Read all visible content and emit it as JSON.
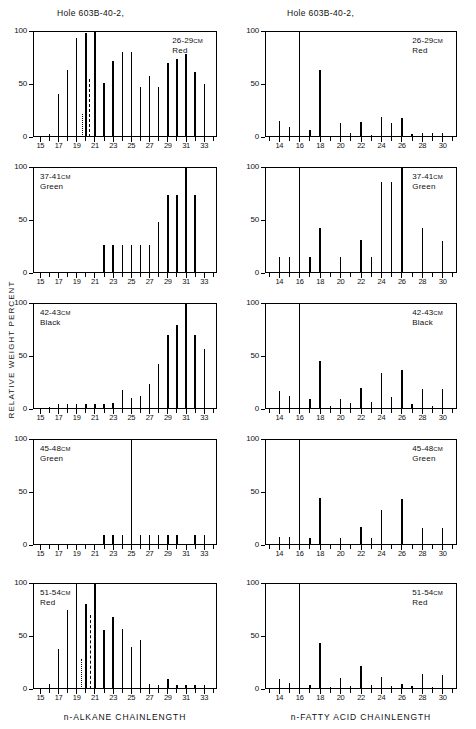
{
  "figure": {
    "y_axis_label": "RELATIVE WEIGHT PERCENT",
    "column_titles": {
      "left": "Hole 603B-40-2,",
      "right": "Hole 603B-40-2,"
    },
    "x_axis_labels": {
      "left": "n-ALKANE  CHAINLENGTH",
      "right": "n-FATTY ACID CHAINLENGTH"
    },
    "y_ticks": [
      "0",
      "50",
      "100"
    ],
    "cm_unit": "CM"
  },
  "chart_data": [
    {
      "type": "bar",
      "panel_id": "alkane-26-29",
      "column": "left",
      "row": 1,
      "title": "Hole 603B-40-2,",
      "annotation_depth": "26-29",
      "annotation_unit": "CM",
      "annotation_color": "Red",
      "xlabel": "n-ALKANE  CHAINLENGTH",
      "ylabel": "RELATIVE WEIGHT PERCENT",
      "xlim": [
        14.2,
        34.4
      ],
      "ylim": [
        0,
        100
      ],
      "grid": false,
      "tick_labels": [
        "15",
        "17",
        "19",
        "21",
        "23",
        "25",
        "27",
        "29",
        "31",
        "33"
      ],
      "x": [
        15,
        16,
        17,
        18,
        19,
        20,
        21,
        22,
        23,
        24,
        25,
        26,
        27,
        28,
        29,
        30,
        31,
        32,
        33,
        34
      ],
      "values": [
        0,
        3,
        41,
        63,
        93,
        98,
        100,
        51,
        72,
        80,
        80,
        47,
        58,
        47,
        70,
        74,
        78,
        61,
        50,
        0
      ],
      "markers": [
        {
          "name": "pristane",
          "x": 19.65,
          "value": 22,
          "style": "dotted"
        },
        {
          "name": "phytane",
          "x": 20.45,
          "value": 55,
          "style": "dashed"
        }
      ]
    },
    {
      "type": "bar",
      "panel_id": "fattyacid-26-29",
      "column": "right",
      "row": 1,
      "title": "Hole 603B-40-2,",
      "annotation_depth": "26-29",
      "annotation_unit": "CM",
      "annotation_color": "Red",
      "xlabel": "n-FATTY ACID CHAINLENGTH",
      "ylabel": "RELATIVE WEIGHT PERCENT",
      "xlim": [
        12.6,
        31.4
      ],
      "ylim": [
        0,
        100
      ],
      "grid": false,
      "tick_labels": [
        "14",
        "16",
        "18",
        "20",
        "22",
        "24",
        "26",
        "28",
        "30"
      ],
      "x": [
        13,
        14,
        15,
        16,
        17,
        18,
        19,
        20,
        21,
        22,
        23,
        24,
        25,
        26,
        27,
        28,
        29,
        30,
        31
      ],
      "values": [
        0,
        15,
        9,
        100,
        7,
        63,
        0,
        13,
        4,
        14,
        2,
        19,
        13,
        18,
        3,
        4,
        4,
        4,
        0
      ],
      "markers": []
    },
    {
      "type": "bar",
      "panel_id": "alkane-37-41",
      "column": "left",
      "row": 2,
      "annotation_depth": "37-41",
      "annotation_unit": "CM",
      "annotation_color": "Green",
      "xlabel": "n-ALKANE  CHAINLENGTH",
      "ylabel": "RELATIVE WEIGHT PERCENT",
      "xlim": [
        14.2,
        34.4
      ],
      "ylim": [
        0,
        100
      ],
      "grid": false,
      "tick_labels": [
        "15",
        "17",
        "19",
        "21",
        "23",
        "25",
        "27",
        "29",
        "31",
        "33"
      ],
      "x": [
        15,
        16,
        17,
        18,
        19,
        20,
        21,
        22,
        23,
        24,
        25,
        26,
        27,
        28,
        29,
        30,
        31,
        32,
        33,
        34
      ],
      "values": [
        0,
        0,
        0,
        0,
        0,
        0,
        0,
        26,
        26,
        26,
        26,
        26,
        26,
        48,
        74,
        74,
        100,
        74,
        0,
        0
      ],
      "markers": []
    },
    {
      "type": "bar",
      "panel_id": "fattyacid-37-41",
      "column": "right",
      "row": 2,
      "annotation_depth": "37-41",
      "annotation_unit": "CM",
      "annotation_color": "Green",
      "xlabel": "n-FATTY ACID CHAINLENGTH",
      "ylabel": "RELATIVE WEIGHT PERCENT",
      "xlim": [
        12.6,
        31.4
      ],
      "ylim": [
        0,
        100
      ],
      "grid": false,
      "tick_labels": [
        "14",
        "16",
        "18",
        "20",
        "22",
        "24",
        "26",
        "28",
        "30"
      ],
      "x": [
        13,
        14,
        15,
        16,
        17,
        18,
        19,
        20,
        21,
        22,
        23,
        24,
        25,
        26,
        27,
        28,
        29,
        30,
        31
      ],
      "values": [
        0,
        15,
        15,
        100,
        15,
        42,
        0,
        15,
        0,
        31,
        15,
        86,
        86,
        100,
        0,
        42,
        0,
        30,
        0
      ],
      "markers": []
    },
    {
      "type": "bar",
      "panel_id": "alkane-42-43",
      "column": "left",
      "row": 3,
      "annotation_depth": "42-43",
      "annotation_unit": "CM",
      "annotation_color": "Black",
      "xlabel": "n-ALKANE  CHAINLENGTH",
      "ylabel": "RELATIVE WEIGHT PERCENT",
      "xlim": [
        14.2,
        34.4
      ],
      "ylim": [
        0,
        100
      ],
      "grid": false,
      "tick_labels": [
        "15",
        "17",
        "19",
        "21",
        "23",
        "25",
        "27",
        "29",
        "31",
        "33"
      ],
      "x": [
        15,
        16,
        17,
        18,
        19,
        20,
        21,
        22,
        23,
        24,
        25,
        26,
        27,
        28,
        29,
        30,
        31,
        32,
        33,
        34
      ],
      "values": [
        0,
        2,
        5,
        5,
        5,
        5,
        5,
        5,
        6,
        18,
        10,
        12,
        24,
        42,
        70,
        79,
        100,
        70,
        57,
        0
      ],
      "markers": []
    },
    {
      "type": "bar",
      "panel_id": "fattyacid-42-43",
      "column": "right",
      "row": 3,
      "annotation_depth": "42-43",
      "annotation_unit": "CM",
      "annotation_color": "Black",
      "xlabel": "n-FATTY ACID CHAINLENGTH",
      "ylabel": "RELATIVE WEIGHT PERCENT",
      "xlim": [
        12.6,
        31.4
      ],
      "ylim": [
        0,
        100
      ],
      "grid": false,
      "tick_labels": [
        "14",
        "16",
        "18",
        "20",
        "22",
        "24",
        "26",
        "28",
        "30"
      ],
      "x": [
        13,
        14,
        15,
        16,
        17,
        18,
        19,
        20,
        21,
        22,
        23,
        24,
        25,
        26,
        27,
        28,
        29,
        30,
        31
      ],
      "values": [
        0,
        17,
        12,
        100,
        9,
        45,
        3,
        9,
        6,
        20,
        7,
        34,
        11,
        37,
        5,
        19,
        3,
        19,
        0
      ],
      "markers": []
    },
    {
      "type": "bar",
      "panel_id": "alkane-45-48",
      "column": "left",
      "row": 4,
      "annotation_depth": "45-48",
      "annotation_unit": "CM",
      "annotation_color": "Green",
      "xlabel": "n-ALKANE  CHAINLENGTH",
      "ylabel": "RELATIVE WEIGHT PERCENT",
      "xlim": [
        14.2,
        34.4
      ],
      "ylim": [
        0,
        100
      ],
      "grid": false,
      "tick_labels": [
        "15",
        "17",
        "19",
        "21",
        "23",
        "25",
        "27",
        "29",
        "31",
        "33"
      ],
      "x": [
        15,
        16,
        17,
        18,
        19,
        20,
        21,
        22,
        23,
        24,
        25,
        26,
        27,
        28,
        29,
        30,
        31,
        32,
        33,
        34
      ],
      "values": [
        0,
        0,
        0,
        0,
        0,
        0,
        0,
        9,
        9,
        9,
        100,
        9,
        9,
        9,
        9,
        9,
        0,
        9,
        9,
        0
      ],
      "markers": []
    },
    {
      "type": "bar",
      "panel_id": "fattyacid-45-48",
      "column": "right",
      "row": 4,
      "annotation_depth": "45-48",
      "annotation_unit": "CM",
      "annotation_color": "Green",
      "xlabel": "n-FATTY ACID CHAINLENGTH",
      "ylabel": "RELATIVE WEIGHT PERCENT",
      "xlim": [
        12.6,
        31.4
      ],
      "ylim": [
        0,
        100
      ],
      "grid": false,
      "tick_labels": [
        "14",
        "16",
        "18",
        "20",
        "22",
        "24",
        "26",
        "28",
        "30"
      ],
      "x": [
        13,
        14,
        15,
        16,
        17,
        18,
        19,
        20,
        21,
        22,
        23,
        24,
        25,
        26,
        27,
        28,
        29,
        30,
        31
      ],
      "values": [
        0,
        8,
        8,
        100,
        7,
        44,
        0,
        7,
        0,
        17,
        7,
        33,
        0,
        43,
        0,
        16,
        0,
        16,
        0
      ],
      "markers": []
    },
    {
      "type": "bar",
      "panel_id": "alkane-51-54",
      "column": "left",
      "row": 5,
      "annotation_depth": "51-54",
      "annotation_unit": "CM",
      "annotation_color": "Red",
      "xlabel": "n-ALKANE  CHAINLENGTH",
      "ylabel": "RELATIVE WEIGHT PERCENT",
      "xlim": [
        14.2,
        34.4
      ],
      "ylim": [
        0,
        100
      ],
      "grid": false,
      "tick_labels": [
        "15",
        "17",
        "19",
        "21",
        "23",
        "25",
        "27",
        "29",
        "31",
        "33"
      ],
      "x": [
        15,
        16,
        17,
        18,
        19,
        20,
        21,
        22,
        23,
        24,
        25,
        26,
        27,
        28,
        29,
        30,
        31,
        32,
        33,
        34
      ],
      "values": [
        0,
        5,
        38,
        75,
        100,
        80,
        100,
        56,
        68,
        57,
        40,
        46,
        5,
        4,
        9,
        4,
        4,
        4,
        4,
        0
      ],
      "markers": [
        {
          "name": "pristane",
          "x": 19.6,
          "value": 28,
          "style": "dotted"
        },
        {
          "name": "phytane",
          "x": 20.5,
          "value": 70,
          "style": "dashed"
        }
      ]
    },
    {
      "type": "bar",
      "panel_id": "fattyacid-51-54",
      "column": "right",
      "row": 5,
      "annotation_depth": "51-54",
      "annotation_unit": "CM",
      "annotation_color": "Red",
      "xlabel": "n-FATTY ACID CHAINLENGTH",
      "ylabel": "RELATIVE WEIGHT PERCENT",
      "xlim": [
        12.6,
        31.4
      ],
      "ylim": [
        0,
        100
      ],
      "grid": false,
      "tick_labels": [
        "14",
        "16",
        "18",
        "20",
        "22",
        "24",
        "26",
        "28",
        "30"
      ],
      "x": [
        13,
        14,
        15,
        16,
        17,
        18,
        19,
        20,
        21,
        22,
        23,
        24,
        25,
        26,
        27,
        28,
        29,
        30,
        31
      ],
      "values": [
        0,
        9,
        6,
        100,
        4,
        43,
        2,
        10,
        3,
        22,
        4,
        11,
        3,
        5,
        3,
        14,
        2,
        13,
        0
      ],
      "markers": []
    }
  ]
}
